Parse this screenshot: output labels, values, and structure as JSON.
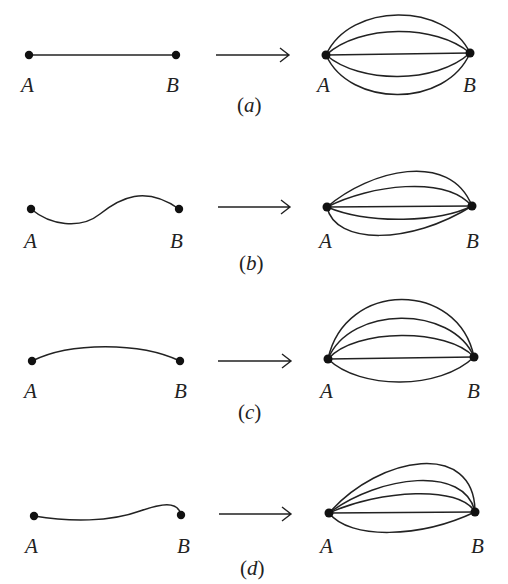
{
  "figure": {
    "stroke_color": "#222222",
    "background": "#ffffff",
    "panels": [
      {
        "id": "a",
        "caption_open": "(",
        "caption_letter": "a",
        "caption_close": ")",
        "left": {
          "label_a": "A",
          "label_b": "B",
          "point_a": [
            29,
            55
          ],
          "point_b": [
            176,
            55
          ],
          "path": "M29,55 L176,55"
        },
        "right": {
          "label_a": "A",
          "label_b": "B",
          "point_a": [
            326,
            55
          ],
          "point_b": [
            470,
            53
          ],
          "paths": [
            "M326,55 C350,2 446,2 470,53",
            "M326,55 C360,24 436,24 470,53",
            "M326,55 L470,53",
            "M326,55 C360,84 436,84 470,53",
            "M326,55 C350,108 446,108 470,53"
          ]
        },
        "arrow": {
          "x1": 216,
          "x2": 289,
          "y": 55
        }
      },
      {
        "id": "b",
        "caption_open": "(",
        "caption_letter": "b",
        "caption_close": ")",
        "left": {
          "label_a": "A",
          "label_b": "B",
          "point_a": [
            31,
            209
          ],
          "point_b": [
            179,
            209
          ],
          "path": "M31,209 C50,225 80,230 100,214 C120,198 145,185 179,209"
        },
        "right": {
          "label_a": "A",
          "label_b": "B",
          "point_a": [
            327,
            207
          ],
          "point_b": [
            472,
            206
          ],
          "paths": [
            "M327,207 C370,170 450,150 472,206",
            "M327,207 C370,185 445,175 472,206",
            "M327,207 L472,206",
            "M327,207 C370,225 440,222 472,206",
            "M327,207 C335,245 410,245 472,206"
          ]
        },
        "arrow": {
          "x1": 218,
          "x2": 290,
          "y": 207
        }
      },
      {
        "id": "c",
        "caption_open": "(",
        "caption_letter": "c",
        "caption_close": ")",
        "left": {
          "label_a": "A",
          "label_b": "B",
          "point_a": [
            32,
            361
          ],
          "point_b": [
            180,
            361
          ],
          "path": "M32,361 C70,342 140,342 180,361"
        },
        "right": {
          "label_a": "A",
          "label_b": "B",
          "point_a": [
            328,
            359
          ],
          "point_b": [
            474,
            357
          ],
          "paths": [
            "M328,359 C345,280 458,280 474,357",
            "M328,359 C350,305 452,305 474,357",
            "M328,359 C355,328 448,328 474,357",
            "M328,359 L474,357",
            "M328,359 C360,390 440,390 474,357"
          ]
        },
        "arrow": {
          "x1": 218,
          "x2": 291,
          "y": 361
        }
      },
      {
        "id": "d",
        "caption_open": "(",
        "caption_letter": "d",
        "caption_close": ")",
        "left": {
          "label_a": "A",
          "label_b": "B",
          "point_a": [
            34,
            516
          ],
          "point_b": [
            181,
            515
          ],
          "path": "M34,516 C70,522 110,522 140,511 C160,504 178,500 181,515"
        },
        "right": {
          "label_a": "A",
          "label_b": "B",
          "point_a": [
            329,
            513
          ],
          "point_b": [
            475,
            512
          ],
          "paths": [
            "M329,513 C380,455 475,440 475,512",
            "M329,513 C380,475 465,465 475,512",
            "M329,513 C380,490 460,485 475,512",
            "M329,513 L475,512",
            "M329,513 C350,540 420,538 475,512"
          ]
        },
        "arrow": {
          "x1": 219,
          "x2": 291,
          "y": 514
        }
      }
    ]
  }
}
